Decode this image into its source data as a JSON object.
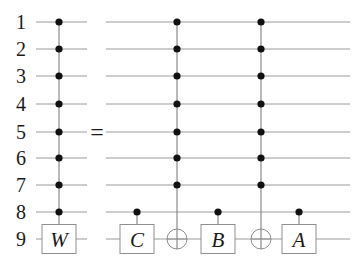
{
  "diagram": {
    "type": "quantum-circuit-identity",
    "qubit_labels": [
      "1",
      "2",
      "3",
      "4",
      "5",
      "6",
      "7",
      "8",
      "9"
    ],
    "equals_symbol": "=",
    "lhs": {
      "gates": [
        {
          "kind": "controlled-unitary",
          "label": "W",
          "controls": [
            1,
            2,
            3,
            4,
            5,
            6,
            7,
            8
          ],
          "target": 9
        }
      ]
    },
    "rhs": {
      "gates": [
        {
          "kind": "controlled-unitary",
          "label": "C",
          "controls": [
            8
          ],
          "target": 9
        },
        {
          "kind": "multi-controlled-not",
          "label": "",
          "controls": [
            1,
            2,
            3,
            4,
            5,
            6,
            7
          ],
          "target": 9
        },
        {
          "kind": "controlled-unitary",
          "label": "B",
          "controls": [
            8
          ],
          "target": 9
        },
        {
          "kind": "multi-controlled-not",
          "label": "",
          "controls": [
            1,
            2,
            3,
            4,
            5,
            6,
            7
          ],
          "target": 9
        },
        {
          "kind": "controlled-unitary",
          "label": "A",
          "controls": [
            8
          ],
          "target": 9
        }
      ]
    },
    "colors": {
      "wire": "#9a9a9a",
      "dot": "#111111",
      "text": "#1a1a1a"
    }
  }
}
